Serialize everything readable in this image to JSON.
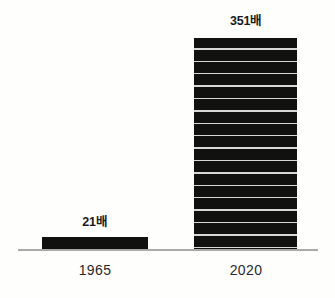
{
  "chart_data": {
    "type": "bar",
    "title": "",
    "subtitle": "",
    "xlabel": "",
    "ylabel": "",
    "categories": [
      "1965",
      "2020"
    ],
    "values": [
      21,
      351
    ],
    "value_labels": [
      "21배",
      "351배"
    ],
    "unit_suffix": "배",
    "ylim": [
      0,
      351
    ],
    "grid": false,
    "legend": null,
    "legend_position": "none",
    "series": [
      {
        "name": "",
        "values": [
          21,
          351
        ],
        "color": "#111110"
      }
    ],
    "annotations": [],
    "bar_style": {
      "fill": "#111110",
      "segmented": true,
      "segment_rule_color": "#d8d8d4",
      "segment_count": 17
    },
    "axis": {
      "baseline_color": "#a9a9a6",
      "axis_visible": true,
      "ticks_visible": false
    },
    "background_color": "#fefefd"
  },
  "chart": {
    "bars": [
      {
        "category": "1965",
        "value_label": "21배",
        "value": 21
      },
      {
        "category": "2020",
        "value_label": "351배",
        "value": 351
      }
    ]
  }
}
